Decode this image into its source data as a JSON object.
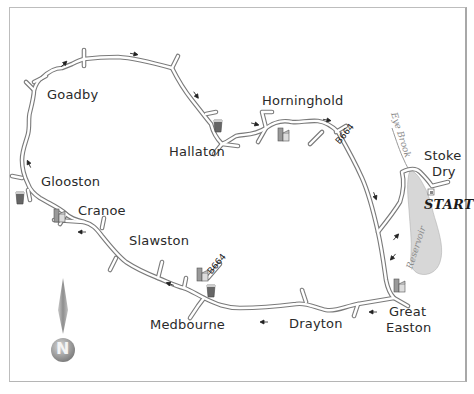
{
  "map": {
    "type": "route-map",
    "start_label": "START",
    "villages": [
      {
        "name": "Goadby",
        "x": 47,
        "y": 87
      },
      {
        "name": "Hallaton",
        "x": 169,
        "y": 144
      },
      {
        "name": "Horninghold",
        "x": 262,
        "y": 93
      },
      {
        "name": "Stoke",
        "x": 424,
        "y": 148
      },
      {
        "name": "Dry",
        "x": 432,
        "y": 164
      },
      {
        "name": "Glooston",
        "x": 41,
        "y": 174
      },
      {
        "name": "Cranoe",
        "x": 78,
        "y": 203
      },
      {
        "name": "Slawston",
        "x": 129,
        "y": 233
      },
      {
        "name": "Medbourne",
        "x": 150,
        "y": 317
      },
      {
        "name": "Drayton",
        "x": 289,
        "y": 316
      },
      {
        "name": "Great",
        "x": 389,
        "y": 304
      },
      {
        "name": "Easton",
        "x": 386,
        "y": 320
      }
    ],
    "road_labels": [
      {
        "text": "B664",
        "x": 347,
        "y": 137,
        "angle": -50
      },
      {
        "text": "B664",
        "x": 216,
        "y": 268,
        "angle": -50
      }
    ],
    "water_labels": [
      {
        "text": "Eye Brook",
        "x": 389,
        "y": 106,
        "angle": 72
      },
      {
        "text": "Reservoir",
        "x": 417,
        "y": 258,
        "angle": -72
      }
    ],
    "legend": {
      "compass_letter": "N"
    },
    "symbols": {
      "pubs": [
        "Hallaton",
        "Glooston",
        "Medbourne"
      ],
      "churches": [
        "Horninghold",
        "Cranoe",
        "Medbourne",
        "Great Easton"
      ],
      "parking": [
        "Stoke Dry"
      ]
    },
    "colors": {
      "road_fill": "#ffffff",
      "road_edge": "#7a7a7a",
      "water": "#d6d6d6",
      "text": "#2a2a2a",
      "frame": "#bdbdbd"
    }
  }
}
